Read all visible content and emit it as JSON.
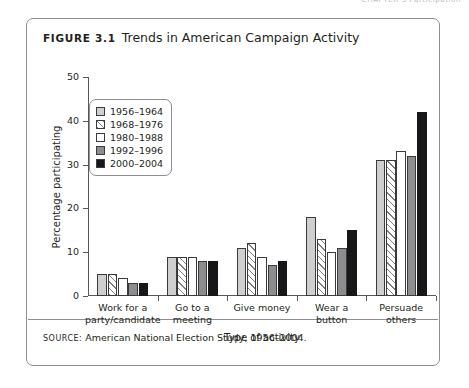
{
  "page_header": "CHAPTER 3  Participation",
  "figure": {
    "number_label": "Figure 3.1",
    "title": "Trends in American Campaign Activity",
    "source_label": "Source:",
    "source_text": "American National Election Study, 1956–2004."
  },
  "chart_data": {
    "type": "bar",
    "title": "Trends in American Campaign Activity",
    "xlabel": "Type of activity",
    "ylabel": "Percentage participating",
    "ylim": [
      0,
      50
    ],
    "yticks": [
      0,
      10,
      20,
      30,
      40,
      50
    ],
    "grid": false,
    "legend_position": "upper-left-inside",
    "categories": [
      "Work for a party/candidate",
      "Go to a meeting",
      "Give money",
      "Wear a button",
      "Persuade others"
    ],
    "category_lines": [
      [
        "Work for a",
        "party/candidate"
      ],
      [
        "Go to a",
        "meeting"
      ],
      [
        "Give money"
      ],
      [
        "Wear a",
        "button"
      ],
      [
        "Persuade",
        "others"
      ]
    ],
    "series": [
      {
        "name": "1956–1964",
        "swatch": "light-gray-solid",
        "color": "#cfcfcf",
        "values": [
          5,
          9,
          11,
          18,
          31
        ]
      },
      {
        "name": "1968–1976",
        "swatch": "diagonal-hatch",
        "color": "#ffffff",
        "values": [
          5,
          9,
          12,
          13,
          31
        ]
      },
      {
        "name": "1980–1988",
        "swatch": "white-solid",
        "color": "#ffffff",
        "values": [
          4,
          9,
          9,
          10,
          33
        ]
      },
      {
        "name": "1992–1996",
        "swatch": "medium-gray-solid",
        "color": "#8d8d90",
        "values": [
          3,
          8,
          7,
          11,
          32
        ]
      },
      {
        "name": "2000–2004",
        "swatch": "black-solid",
        "color": "#17171a",
        "values": [
          3,
          8,
          8,
          15,
          42
        ]
      }
    ]
  }
}
